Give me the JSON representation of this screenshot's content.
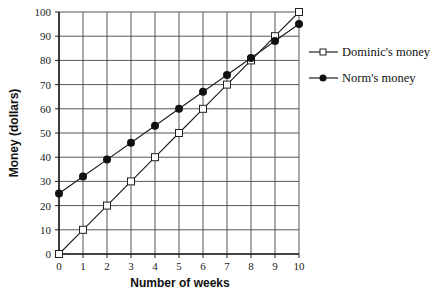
{
  "chart_data": {
    "type": "line",
    "title": "",
    "xlabel": "Number of weeks",
    "ylabel": "Money (dollars)",
    "x": [
      0,
      1,
      2,
      3,
      4,
      5,
      6,
      7,
      8,
      9,
      10
    ],
    "xlim": [
      0,
      10
    ],
    "ylim": [
      0,
      100
    ],
    "x_ticks": [
      0,
      1,
      2,
      3,
      4,
      5,
      6,
      7,
      8,
      9,
      10
    ],
    "y_ticks": [
      0,
      10,
      20,
      30,
      40,
      50,
      60,
      70,
      80,
      90,
      100
    ],
    "grid": true,
    "legend_position": "right",
    "series": [
      {
        "name": "Dominic's money",
        "marker": "open-square",
        "values": [
          0,
          10,
          20,
          30,
          40,
          50,
          60,
          70,
          80,
          90,
          100
        ]
      },
      {
        "name": "Norm's money",
        "marker": "filled-circle",
        "values": [
          25,
          32,
          39,
          46,
          53,
          60,
          67,
          74,
          81,
          88,
          95
        ]
      }
    ]
  },
  "colors": {
    "grid": "#555555",
    "line": "#222222",
    "marker_fill_filled": "#111111",
    "marker_fill_open": "#ffffff"
  }
}
